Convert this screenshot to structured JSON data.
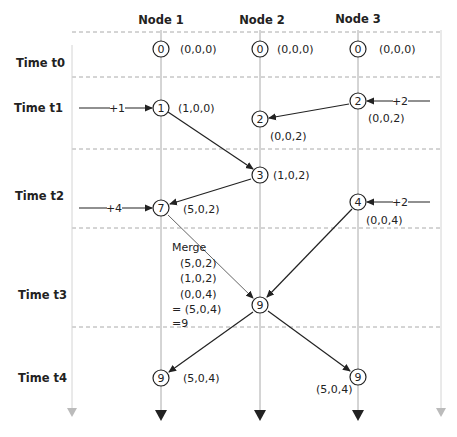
{
  "headers": {
    "node1": "Node 1",
    "node2": "Node 2",
    "node3": "Node 3"
  },
  "times": {
    "t0": "Time t0",
    "t1": "Time t1",
    "t2": "Time t2",
    "t3": "Time t3",
    "t4": "Time t4"
  },
  "events": {
    "n1_t0": {
      "value": "0",
      "vector": "(0,0,0)"
    },
    "n2_t0": {
      "value": "0",
      "vector": "(0,0,0)"
    },
    "n3_t0": {
      "value": "0",
      "vector": "(0,0,0)"
    },
    "n1_t1": {
      "value": "1",
      "vector": "(1,0,0)",
      "increment": "+1"
    },
    "n3_t1": {
      "value": "2",
      "vector": "(0,0,2)",
      "increment": "+2"
    },
    "n2_t1": {
      "value": "2",
      "vector": "(0,0,2)"
    },
    "n2_t2": {
      "value": "3",
      "vector": "(1,0,2)"
    },
    "n1_t2": {
      "value": "7",
      "vector": "(5,0,2)",
      "increment": "+4"
    },
    "n3_t2": {
      "value": "4",
      "vector": "(0,0,4)",
      "increment": "+2"
    },
    "n2_t3": {
      "value": "9"
    },
    "n1_t4": {
      "value": "9",
      "vector": "(5,0,4)"
    },
    "n3_t4": {
      "value": "9",
      "vector": "(5,0,4)"
    }
  },
  "merge": {
    "title": "Merge",
    "line1": "(5,0,2)",
    "line2": "(1,0,2)",
    "line3": "(0,0,4)",
    "result": "= (5,0,4)",
    "total": "=9"
  },
  "colors": {
    "ink": "#222222",
    "node_axis": "#aaaaaa",
    "outer_axis": "#c8c8c8",
    "dashed": "#aaaaaa"
  }
}
